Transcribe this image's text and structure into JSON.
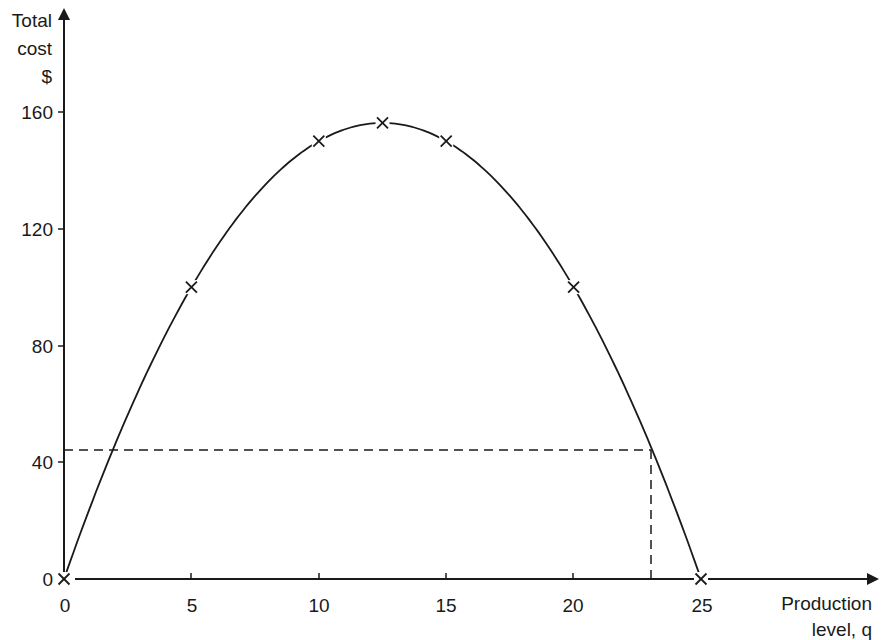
{
  "chart_data": {
    "type": "line",
    "title": "",
    "xlabel_line1": "Production",
    "xlabel_line2": "level, q",
    "ylabel_line1": "Total",
    "ylabel_line2": "cost",
    "ylabel_line3": "$",
    "x_ticks": [
      "0",
      "5",
      "10",
      "15",
      "20",
      "25"
    ],
    "y_ticks": [
      "0",
      "40",
      "80",
      "120",
      "160"
    ],
    "xlim": [
      0,
      25
    ],
    "ylim": [
      0,
      160
    ],
    "grid": false,
    "legend": "none",
    "series": [
      {
        "name": "Total cost",
        "x": [
          0,
          5,
          10,
          12.5,
          15,
          20,
          25
        ],
        "y": [
          0,
          100,
          150,
          156.25,
          150,
          100,
          0
        ],
        "markers": "x"
      }
    ],
    "reference_lines": {
      "horizontal_y": 44,
      "vertical_x": 23
    }
  }
}
